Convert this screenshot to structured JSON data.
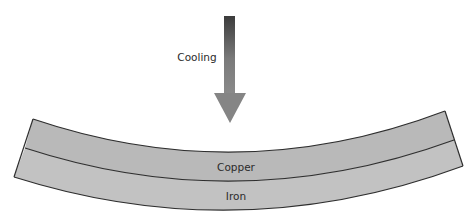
{
  "diagram": {
    "arrow": {
      "label": "Cooling",
      "icon": "down-arrow-icon",
      "gradient_top": "#3c3c3c",
      "gradient_bottom": "#8a8a8a"
    },
    "strip": {
      "layers": [
        {
          "label": "Copper",
          "position": "top",
          "fill": "#b9b9b9"
        },
        {
          "label": "Iron",
          "position": "bottom",
          "fill": "#c2c2c2"
        }
      ],
      "outline": "#2e2e2e"
    }
  }
}
